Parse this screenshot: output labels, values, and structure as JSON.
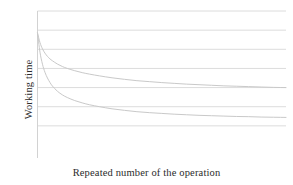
{
  "chart_data": {
    "type": "line",
    "title": "",
    "subtitle": "",
    "xlabel": "Repeated number of the operation",
    "ylabel": "Working time",
    "xlim": [
      0,
      100
    ],
    "ylim": [
      0,
      7
    ],
    "grid": true,
    "grid_axis": "y",
    "grid_count": 7,
    "grid_values": [
      7,
      6,
      5,
      4,
      3,
      2,
      1
    ],
    "legend": null,
    "legend_position": "none",
    "xticks": [],
    "yticks": [],
    "xticklabels": [],
    "yticklabels": [],
    "annotations": [],
    "x": [
      0,
      1,
      2,
      3,
      4,
      5,
      6,
      8,
      10,
      12,
      15,
      18,
      21,
      25,
      30,
      35,
      40,
      45,
      50,
      55,
      60,
      65,
      70,
      75,
      80,
      85,
      90,
      95,
      100
    ],
    "series": [
      {
        "name": "slow-learning curve",
        "color": "#c9c9c9",
        "values": [
          5.85,
          5.35,
          5.02,
          4.8,
          4.63,
          4.5,
          4.4,
          4.23,
          4.1,
          4.0,
          3.88,
          3.78,
          3.7,
          3.61,
          3.51,
          3.43,
          3.36,
          3.31,
          3.26,
          3.22,
          3.18,
          3.15,
          3.12,
          3.09,
          3.07,
          3.05,
          3.03,
          3.01,
          3.0
        ]
      },
      {
        "name": "fast-learning curve",
        "color": "#c9c9c9",
        "values": [
          5.85,
          4.85,
          4.22,
          3.8,
          3.5,
          3.27,
          3.08,
          2.81,
          2.62,
          2.48,
          2.32,
          2.2,
          2.1,
          2.0,
          1.89,
          1.81,
          1.74,
          1.69,
          1.65,
          1.61,
          1.58,
          1.55,
          1.53,
          1.51,
          1.49,
          1.48,
          1.46,
          1.45,
          1.44
        ]
      }
    ]
  },
  "style": {
    "grid_color": "#dcdcdc",
    "axis_color": "#d2d2d2",
    "curve_color": "#c9c9c9",
    "background": "#ffffff",
    "text_color": "#2b2b2b"
  }
}
